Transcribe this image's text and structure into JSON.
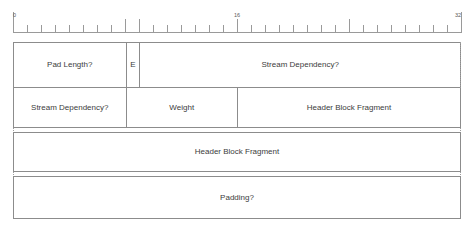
{
  "diagram": {
    "ruler": {
      "bit_width": 32,
      "labels": [
        {
          "text": "0",
          "bit": 0
        },
        {
          "text": "16",
          "bit": 16
        },
        {
          "text": "32",
          "bit": 32
        }
      ],
      "major_ticks": [
        0,
        8,
        9,
        16,
        24,
        32
      ],
      "minor_tick_step": 1
    },
    "rows": [
      {
        "name": "row-1",
        "cells": [
          {
            "label": "Pad Length?",
            "bits": 8,
            "name": "field-pad-length"
          },
          {
            "label": "E",
            "bits": 1,
            "name": "field-e-flag"
          },
          {
            "label": "Stream Dependency?",
            "bits": 23,
            "name": "field-stream-dependency-high"
          }
        ]
      },
      {
        "name": "row-2",
        "cells": [
          {
            "label": "Stream Dependency?",
            "bits": 8,
            "name": "field-stream-dependency-low"
          },
          {
            "label": "Weight",
            "bits": 8,
            "name": "field-weight"
          },
          {
            "label": "Header Block Fragment",
            "bits": 16,
            "name": "field-header-block-fragment-a"
          }
        ]
      },
      {
        "name": "row-3",
        "cells": [
          {
            "label": "Header Block Fragment",
            "bits": 32,
            "name": "field-header-block-fragment-b"
          }
        ]
      },
      {
        "name": "row-4",
        "cells": [
          {
            "label": "Padding?",
            "bits": 32,
            "name": "field-padding"
          }
        ]
      }
    ],
    "colors": {
      "line": "#8c8c8c",
      "ruler_line": "#9a9a9a",
      "dotted": "#9e9e9e",
      "text": "#3c3c3c",
      "background": "#ffffff"
    }
  }
}
